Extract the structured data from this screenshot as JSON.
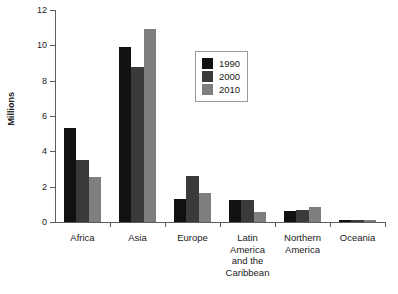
{
  "chart_data": {
    "type": "bar",
    "title": "",
    "xlabel": "",
    "ylabel": "Millions",
    "ylim": [
      0,
      12
    ],
    "yticks": [
      0,
      2,
      4,
      6,
      8,
      10,
      12
    ],
    "ytick_labels": [
      "0",
      "2",
      "4",
      "6",
      "8",
      "10",
      "12"
    ],
    "grid": false,
    "legend_position": "upper center",
    "categories": [
      "Africa",
      "Asia",
      "Europe",
      "Latin America and the Caribbean",
      "Northern America",
      "Oceania"
    ],
    "category_label_lines": [
      [
        "Africa"
      ],
      [
        "Asia"
      ],
      [
        "Europe"
      ],
      [
        "Latin",
        "America",
        "and the",
        "Caribbean"
      ],
      [
        "Northern",
        "America"
      ],
      [
        "Oceania"
      ]
    ],
    "series": [
      {
        "name": "1990",
        "color": "#111111",
        "values": [
          5.3,
          9.9,
          1.3,
          1.25,
          0.65,
          0.1
        ]
      },
      {
        "name": "2000",
        "color": "#3a3a3a",
        "values": [
          3.5,
          8.8,
          2.6,
          1.25,
          0.7,
          0.1
        ]
      },
      {
        "name": "2010",
        "color": "#7e7e7e",
        "values": [
          2.55,
          10.9,
          1.65,
          0.55,
          0.85,
          0.1
        ]
      }
    ]
  }
}
